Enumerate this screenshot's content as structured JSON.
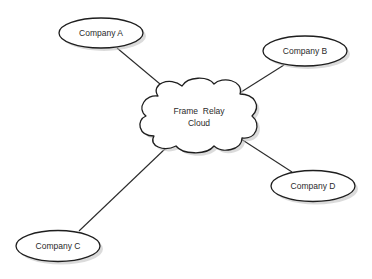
{
  "diagram": {
    "center": {
      "label_line1": "Frame  Relay",
      "label_line2": "Cloud",
      "shape": "cloud"
    },
    "nodes": [
      {
        "id": "A",
        "label": "Company A",
        "shape": "ellipse"
      },
      {
        "id": "B",
        "label": "Company B",
        "shape": "ellipse"
      },
      {
        "id": "C",
        "label": "Company C",
        "shape": "ellipse"
      },
      {
        "id": "D",
        "label": "Company D",
        "shape": "ellipse"
      }
    ],
    "edges": [
      {
        "from": "Company A",
        "to": "Frame Relay Cloud"
      },
      {
        "from": "Company B",
        "to": "Frame Relay Cloud"
      },
      {
        "from": "Company C",
        "to": "Frame Relay Cloud"
      },
      {
        "from": "Company D",
        "to": "Frame Relay Cloud"
      }
    ],
    "colors": {
      "stroke": "#1e1e1e",
      "fill": "#ffffff",
      "shadow": "#bdbdbd",
      "text": "#2a2a2a"
    }
  }
}
